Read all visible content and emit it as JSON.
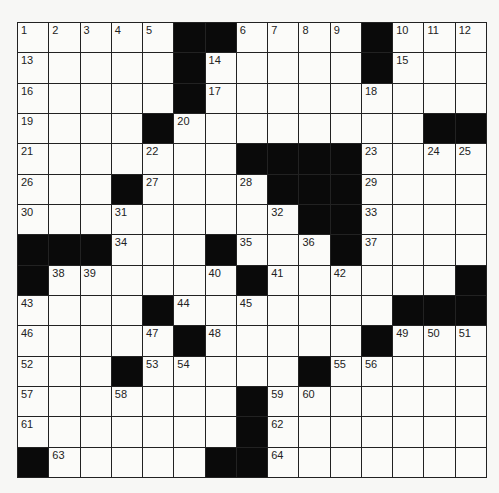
{
  "puzzle": {
    "rows": 15,
    "cols": 15,
    "colors": {
      "black": "#0a0a0a",
      "white": "#fbfbf9",
      "line": "#222222"
    },
    "grid": [
      "1:2:3:4:5:#:#:6:7:8:9:#:10:11:12",
      "13:.:.:.:.:#:14:.:.:.:.:#:15:.:.",
      "16:.:.:.:.:#:17:.:.:.:.:18:.:.:.",
      "19:.:.:.:#:20:.:.:.:.:.:.:.:#:#",
      "21:.:.:.:22:.:.:#:#:#:#:23:.:24:25",
      "26:.:.:#:27:.:.:28:#:#:#:29:.:.:.",
      "30:.:.:31:.:.:.:.:32:#:#:33:.:.:.",
      "#:#:#:34:.:.:#:35:.:36:#:37:.:.:.",
      "#:38:39:.:.:.:40:#:41:.:42:.:.:.:#",
      "43:.:.:.:#:44:.:45:.:.:.:.:#:#:#",
      "46:.:.:.:47:#:48:.:.:.:.:#:49:50:51",
      "52:.:.:#:53:54:.:.:.:#:55:56:.:.:.",
      "57:.:.:58:.:.:.:#:59:60:.:.:.:.:.",
      "61:.:.:.:.:.:.:#:62:.:.:.:.:.:.",
      "#:63:.:.:.:.:#:#:64:.:.:.:.:.:."
    ]
  }
}
